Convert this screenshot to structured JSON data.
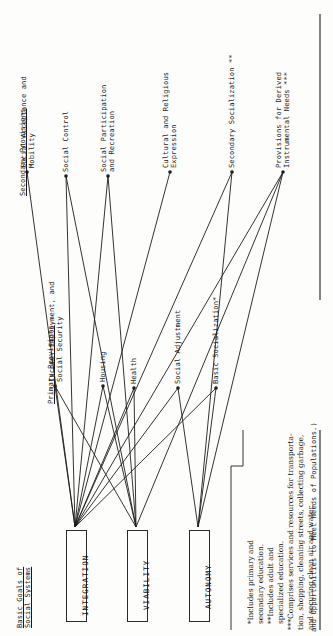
{
  "figure": {
    "title_fragment": "and Opportunities to Meet Needs of Populations.)",
    "column_headers": {
      "goals": "Basic Goals of\nSocial Systems",
      "primary": "Primary Provisions",
      "secondary": "Secondary Provisions"
    },
    "goals": [
      {
        "id": "integration",
        "label": "INTEGRATION"
      },
      {
        "id": "viability",
        "label": "VIABILITY"
      },
      {
        "id": "autonomy",
        "label": "AUTONOMY"
      }
    ],
    "primary_provisions": [
      {
        "id": "income",
        "label": "Income, Employment, and\nSocial Security"
      },
      {
        "id": "housing",
        "label": "Housing"
      },
      {
        "id": "health",
        "label": "Health"
      },
      {
        "id": "social-adjustment",
        "label": "Social Adjustment"
      },
      {
        "id": "basic-socialization",
        "label": "Basic Socialization*"
      }
    ],
    "secondary_provisions": [
      {
        "id": "social-acceptance",
        "label": "Social Acceptance and\nMobility"
      },
      {
        "id": "social-control",
        "label": "Social Control"
      },
      {
        "id": "social-participation",
        "label": "Social Participation\nand Recreation"
      },
      {
        "id": "cultural-religious",
        "label": "Cultural and Religious\nExpression"
      },
      {
        "id": "secondary-socialization",
        "label": "Secondary Socialization **"
      },
      {
        "id": "derived-instrumental",
        "label": "Provisions for Derived\nInstrumental Needs ***"
      }
    ],
    "footnotes": [
      "*Includes primary and",
      "secondary education.",
      "**Includes adult and",
      "specialized education.",
      "***Comprises services and resources for transporta-",
      "tion, shopping, cleaning streets, collecting garbage,",
      "and securing clean air and water."
    ],
    "colors": {
      "ink": "#1d1d1d",
      "paper": "#fdfdfb"
    }
  }
}
